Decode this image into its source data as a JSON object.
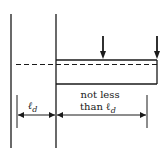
{
  "diagram": {
    "labels": {
      "left_dimension": "ℓ",
      "left_dimension_sub": "d",
      "right_dimension_line1": "not less",
      "right_dimension_line2": "than ℓ",
      "right_dimension_sub": "d"
    },
    "colors": {
      "line": "#1a1a1a",
      "background": "#ffffff"
    }
  }
}
